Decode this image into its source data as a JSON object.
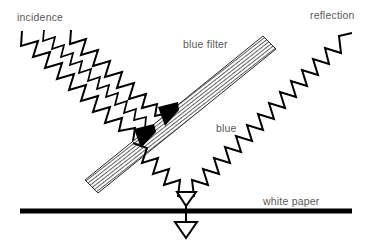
{
  "figure": {
    "background_color": "#ffffff",
    "ink_color": "#000000",
    "label_color": "#5a5a5a",
    "width": 372,
    "height": 244
  },
  "labels": {
    "incidence": "incidence",
    "reflection": "reflection",
    "blue_filter": "blue filter",
    "blue": "blue",
    "white_paper": "white paper"
  },
  "elements": {
    "incident_beam": {
      "name": "incident-light-waves",
      "wave_count": 3,
      "description": "three parallel zigzag waves travelling down-right"
    },
    "reflected_beam": {
      "name": "reflected-light-wave",
      "wave_count": 1,
      "description": "single zigzag wave travelling up-right"
    },
    "transmitted_beam": {
      "name": "transmitted-blue-wave",
      "wave_count": 1,
      "description": "zigzag wave from filter down to paper surface"
    },
    "filter": {
      "name": "blue-filter-bar",
      "fill": "hatched",
      "angle_deg": -38,
      "arrowheads": 2
    },
    "paper": {
      "name": "white-paper-surface",
      "stroke_width": 5
    },
    "absorption_arrow": {
      "name": "absorbed-light-arrow",
      "direction": "down"
    }
  }
}
